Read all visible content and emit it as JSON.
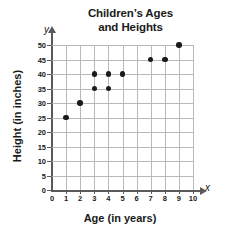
{
  "chart_data": {
    "type": "scatter",
    "title_line1": "Children’s Ages",
    "title_line2": "and Heights",
    "xlabel": "Age (in years)",
    "ylabel": "Height (in inches)",
    "x_axis_letter": "x",
    "y_axis_letter": "y",
    "xlim": [
      0,
      10
    ],
    "ylim": [
      0,
      50
    ],
    "x_ticks": [
      0,
      1,
      2,
      3,
      4,
      5,
      6,
      7,
      8,
      9,
      10
    ],
    "y_ticks": [
      0,
      5,
      10,
      15,
      20,
      25,
      30,
      35,
      40,
      45,
      50
    ],
    "grid": true,
    "grid_x_step": 1,
    "grid_y_step": 5,
    "legend": null,
    "points": [
      {
        "x": 1,
        "y": 25
      },
      {
        "x": 2,
        "y": 30
      },
      {
        "x": 3,
        "y": 35
      },
      {
        "x": 3,
        "y": 40
      },
      {
        "x": 4,
        "y": 35
      },
      {
        "x": 4,
        "y": 40
      },
      {
        "x": 5,
        "y": 40
      },
      {
        "x": 7,
        "y": 45
      },
      {
        "x": 8,
        "y": 45
      },
      {
        "x": 9,
        "y": 50
      }
    ],
    "marker_color": "#1a1a1a",
    "grid_color": "#b9b9b9",
    "axis_color": "#5a5a5a"
  }
}
